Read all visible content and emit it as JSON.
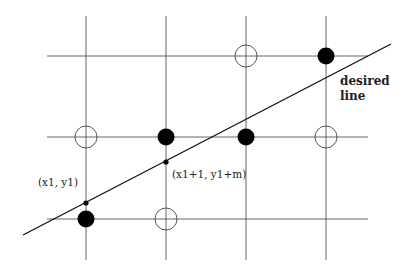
{
  "diagram": {
    "grid": {
      "columns_x": [
        86,
        166,
        246,
        326
      ],
      "rows_y": [
        56,
        137,
        219
      ],
      "vertical_extent": [
        16,
        260
      ],
      "horizontal_extent": [
        47,
        368
      ],
      "color": "#555555"
    },
    "pixels": [
      {
        "col": 0,
        "row": 0,
        "state": "none"
      },
      {
        "col": 1,
        "row": 0,
        "state": "none"
      },
      {
        "col": 2,
        "row": 0,
        "state": "off"
      },
      {
        "col": 3,
        "row": 0,
        "state": "on"
      },
      {
        "col": 0,
        "row": 1,
        "state": "off"
      },
      {
        "col": 1,
        "row": 1,
        "state": "on"
      },
      {
        "col": 2,
        "row": 1,
        "state": "on"
      },
      {
        "col": 3,
        "row": 1,
        "state": "off"
      },
      {
        "col": 0,
        "row": 2,
        "state": "on"
      },
      {
        "col": 1,
        "row": 2,
        "state": "off"
      },
      {
        "col": 2,
        "row": 2,
        "state": "none"
      },
      {
        "col": 3,
        "row": 2,
        "state": "none"
      }
    ],
    "line": {
      "x1": 23,
      "y1": 235,
      "x2": 391,
      "y2": 44,
      "color": "#111111"
    },
    "points": [
      {
        "x": 86,
        "y": 203,
        "label": "(x1, y1)",
        "label_x": 38,
        "label_y": 186
      },
      {
        "x": 166,
        "y": 162,
        "label": "(x1+1, y1+m)",
        "label_x": 172,
        "label_y": 178
      }
    ],
    "line_label": {
      "line1": "desired",
      "line2": "line",
      "x": 340,
      "y1": 85,
      "y2": 100
    }
  }
}
